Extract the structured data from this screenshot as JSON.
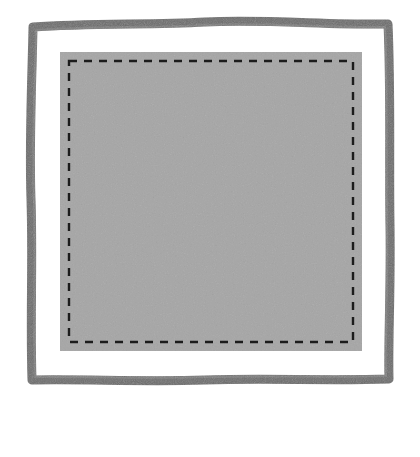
{
  "figure": {
    "type": "diagram",
    "canvas": {
      "width": 420,
      "height": 457,
      "background": "#ffffff"
    }
  },
  "colors": {
    "backing_border": "#6b6b6b",
    "batting_fill": "#ffffff",
    "quilt_top_fill": "#a9a9a9",
    "quilt_top_block": "#9c9c9c",
    "stitch_line": "#1c1c1c",
    "label_text": "#1a1a1a",
    "leader_line": "#1a1a1a"
  },
  "layers": [
    {
      "id": "backing",
      "name": "backing",
      "role": "outermost-layer",
      "shape": "hand-drawn-square-frame",
      "bounds": {
        "x": 31,
        "y": 24,
        "width": 358,
        "height": 357
      },
      "stroke_width": 9,
      "color": "#6b6b6b"
    },
    {
      "id": "batting",
      "name": "batting",
      "role": "middle-layer",
      "shape": "square",
      "bounds": {
        "x": 40,
        "y": 33,
        "width": 340,
        "height": 339
      },
      "color": "#ffffff"
    },
    {
      "id": "quilt-top",
      "name": "quilt top",
      "role": "innermost-layer",
      "shape": "square",
      "bounds": {
        "x": 60,
        "y": 52,
        "width": 302,
        "height": 299
      },
      "color": "#a9a9a9"
    }
  ],
  "labels": [
    {
      "id": "backing",
      "text": "backing",
      "x": 118,
      "y": 424,
      "anchor": "middle"
    },
    {
      "id": "batting",
      "text": "batting",
      "x": 222,
      "y": 424,
      "anchor": "middle"
    },
    {
      "id": "quilt-top",
      "text": "quilt top",
      "x": 325,
      "y": 424,
      "anchor": "middle"
    }
  ],
  "leaders": [
    {
      "id": "backing",
      "from_x": 88,
      "from_y": 400,
      "to_x": 88,
      "to_y": 371,
      "points_to": "backing",
      "arrowhead": "up"
    },
    {
      "id": "batting",
      "from_x": 205,
      "from_y": 400,
      "to_x": 205,
      "to_y": 357,
      "points_to": "batting",
      "arrowhead": "up"
    },
    {
      "id": "quilt-top",
      "from_x": 312,
      "from_y": 400,
      "to_x": 312,
      "to_y": 320,
      "points_to": "quilt top",
      "arrowhead": "up"
    }
  ],
  "stitching": {
    "description": "Dashed grid quilting lines forming a serpentine (boustrophedon) stitching path",
    "grid_cells_x": 9,
    "grid_cells_y": 9,
    "cell_size": 32,
    "dash_pattern": "7 6",
    "stroke_width": 2.4,
    "border_dash_pattern": "8 7",
    "arrow_counts": {
      "top_up_arrows": 7,
      "bottom_down_arrows": 7,
      "left_arrows": 7,
      "right_arrows": 7
    },
    "path_direction": "start lower-right, travel up the right side, then serpentine right-to-left across each row"
  }
}
